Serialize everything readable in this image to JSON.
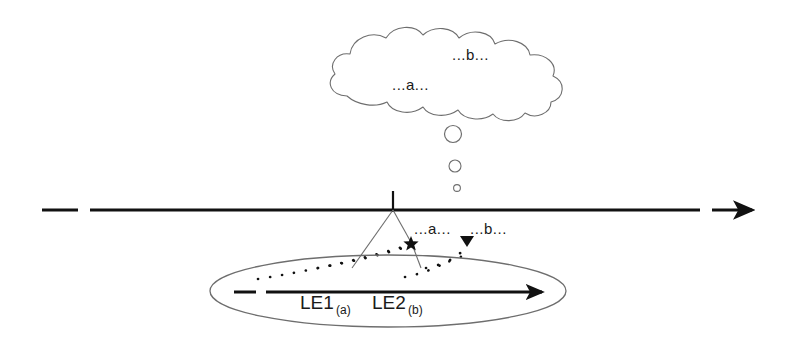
{
  "figure": {
    "type": "conceptual-timeline-diagram",
    "background_color": "#ffffff",
    "stroke_color": "#555555",
    "ink_color": "#1a1a1a"
  },
  "cloud": {
    "name": "thought-cloud",
    "labels": {
      "a": "...a...",
      "b": "...b..."
    }
  },
  "thought_dots": {
    "name": "thought-bubble-trail",
    "count": 3,
    "sizes": [
      9,
      6,
      3.5
    ]
  },
  "timeline": {
    "name": "main-timeline",
    "tick_label": "",
    "labels": {
      "a": "...a...",
      "b": "...b..."
    },
    "markers": {
      "star": "star-marker",
      "triangle": "triangle-marker"
    }
  },
  "ellipse": {
    "name": "embedded-event-ellipse",
    "arrow_label": "",
    "events": [
      {
        "label": "LE1",
        "subscript": "(a)"
      },
      {
        "label": "LE2",
        "subscript": "(b)"
      }
    ]
  }
}
